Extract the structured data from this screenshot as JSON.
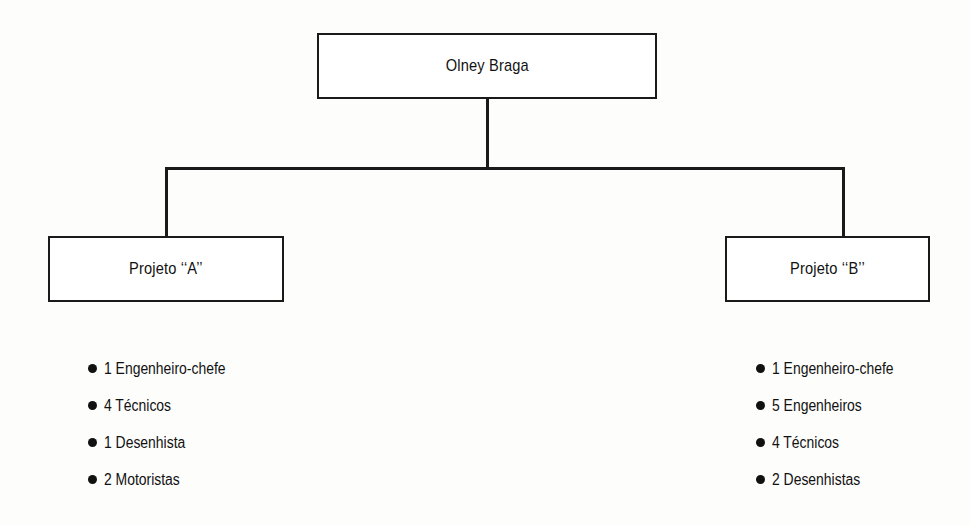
{
  "diagram": {
    "type": "organizational-chart",
    "background_color": "#fdfdfc",
    "line_color": "#1a1a1a",
    "text_color": "#111111",
    "root": {
      "label": "Olney Braga"
    },
    "branches": [
      {
        "id": "projeto-a",
        "label": "Projeto ‘‘A’’",
        "staff": [
          {
            "count": "1",
            "role": "Engenheiro-chefe",
            "text": "1 Engenheiro-chefe"
          },
          {
            "count": "4",
            "role": "Técnicos",
            "text": "4 Técnicos"
          },
          {
            "count": "1",
            "role": "Desenhista",
            "text": "1 Desenhista"
          },
          {
            "count": "2",
            "role": "Motoristas",
            "text": "2 Motoristas"
          }
        ]
      },
      {
        "id": "projeto-b",
        "label": "Projeto ‘‘B’’",
        "staff": [
          {
            "count": "1",
            "role": "Engenheiro-chefe",
            "text": "1 Engenheiro-chefe"
          },
          {
            "count": "5",
            "role": "Engenheiros",
            "text": "5 Engenheiros"
          },
          {
            "count": "4",
            "role": "Técnicos",
            "text": "4 Técnicos"
          },
          {
            "count": "2",
            "role": "Desenhistas",
            "text": "2 Desenhistas"
          }
        ]
      }
    ]
  }
}
